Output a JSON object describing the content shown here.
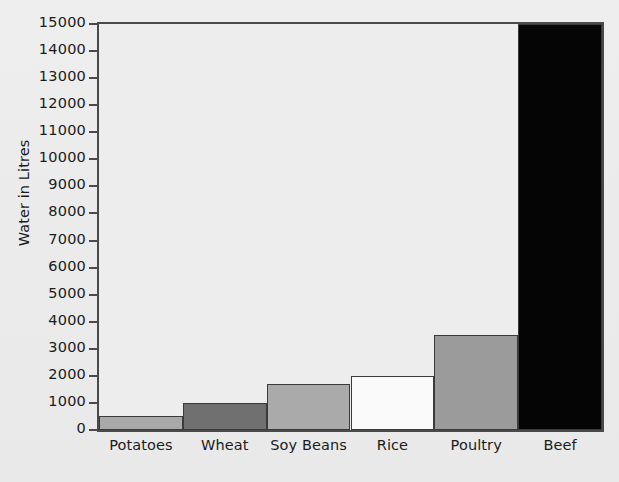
{
  "chart_data": {
    "type": "bar",
    "title": "",
    "subtitle": "",
    "xlabel": "",
    "ylabel": "Water in Litres",
    "categories": [
      "Potatoes",
      "Wheat",
      "Soy Beans",
      "Rice",
      "Poultry",
      "Beef"
    ],
    "values": [
      500,
      1000,
      1700,
      2000,
      3500,
      15100
    ],
    "ylim": [
      0,
      15000
    ],
    "ytick_step": 1000,
    "ytick_labels": [
      "15000",
      "14000",
      "13000",
      "12000",
      "11000",
      "10000",
      "9000",
      "8000",
      "7000",
      "6000",
      "5000",
      "4000",
      "3000",
      "2000",
      "1000",
      "0"
    ],
    "ytick_values": [
      15000,
      14000,
      13000,
      12000,
      11000,
      10000,
      9000,
      8000,
      7000,
      6000,
      5000,
      4000,
      3000,
      2000,
      1000,
      0
    ],
    "grid": false,
    "legend": null,
    "legend_position": "none",
    "bar_gap": 0,
    "bar_colors": [
      "#a9a9a9",
      "#707070",
      "#aaaaaa",
      "#fafafa",
      "#9b9b9b",
      "#050505"
    ],
    "bar_edge_color": "#3a3a3a",
    "axis_color": "#4a4a4a",
    "background_color": "#ebebeb",
    "plot_background_color": "#ededed",
    "text_color": "#1b1b1b",
    "annotations": []
  },
  "figure": {
    "plot_left_px": 97,
    "plot_top_px": 22,
    "plot_width_px": 507,
    "plot_height_px": 410
  }
}
